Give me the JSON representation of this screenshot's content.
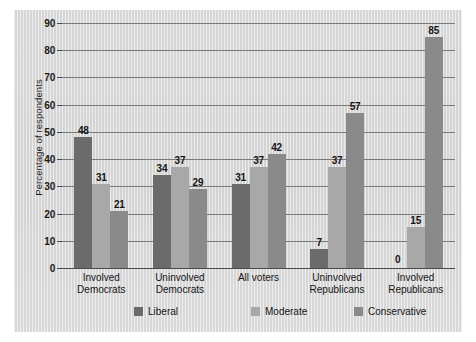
{
  "chart_data": {
    "type": "bar",
    "title": "",
    "subtitle": "",
    "xlabel": "",
    "ylabel": "Percentage of respondents",
    "ylim": [
      0,
      90
    ],
    "ytick_step": 10,
    "yticks": [
      "0",
      "10",
      "20",
      "30",
      "40",
      "50",
      "60",
      "70",
      "80",
      "90"
    ],
    "grid": true,
    "legend_position": "bottom",
    "categories": [
      "Involved Democrats",
      "Uninvolved Democrats",
      "All voters",
      "Uninvolved Republicans",
      "Involved Republicans"
    ],
    "category_lines": [
      [
        "Involved",
        "Democrats"
      ],
      [
        "Uninvolved",
        "Democrats"
      ],
      [
        "All voters",
        ""
      ],
      [
        "Uninvolved",
        "Republicans"
      ],
      [
        "Involved",
        "Republicans"
      ]
    ],
    "series": [
      {
        "name": "Liberal",
        "color": "#6b6b6b",
        "values": [
          48,
          34,
          31,
          7,
          0
        ]
      },
      {
        "name": "Moderate",
        "color": "#a8a8a8",
        "values": [
          31,
          37,
          37,
          37,
          15
        ]
      },
      {
        "name": "Conservative",
        "color": "#8a8a8a",
        "values": [
          21,
          29,
          42,
          57,
          85
        ]
      }
    ],
    "value_labels": [
      [
        "48",
        "31",
        "21"
      ],
      [
        "34",
        "37",
        "29"
      ],
      [
        "31",
        "37",
        "42"
      ],
      [
        "7",
        "37",
        "57"
      ],
      [
        "0",
        "15",
        "85"
      ]
    ]
  },
  "figure": {
    "background_color": "#d6d6d6",
    "gridline_color": "#7a7a7a",
    "text_color": "#151515"
  }
}
